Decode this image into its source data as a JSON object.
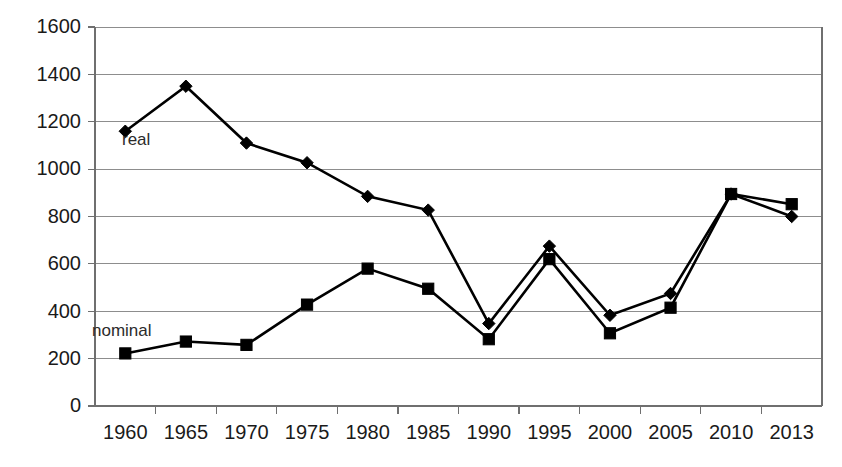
{
  "chart_data": {
    "type": "line",
    "title": "",
    "subtitle": "",
    "xlabel": "",
    "ylabel": "",
    "categories": [
      "1960",
      "1965",
      "1970",
      "1975",
      "1980",
      "1985",
      "1990",
      "1995",
      "2000",
      "2005",
      "2010",
      "2013"
    ],
    "ylim": [
      0,
      1600
    ],
    "ytick_labels": [
      "1600",
      "1400",
      "1200",
      "1000",
      "800",
      "600",
      "400",
      "200",
      "0"
    ],
    "ytick_values": [
      1600,
      1400,
      1200,
      1000,
      800,
      600,
      400,
      200,
      0
    ],
    "ytick_step": 200,
    "grid": true,
    "grid_axis": "y",
    "legend_position": "inline-annotation",
    "series": [
      {
        "name": "real",
        "marker": "diamond",
        "color": "#000000",
        "annotation": "real",
        "values": [
          1160,
          1350,
          1110,
          1027,
          885,
          827,
          348,
          675,
          383,
          475,
          895,
          800
        ]
      },
      {
        "name": "nominal",
        "marker": "square",
        "color": "#000000",
        "annotation": "nominal",
        "values": [
          222,
          272,
          258,
          428,
          580,
          495,
          282,
          620,
          307,
          415,
          895,
          852
        ]
      }
    ],
    "annotations": [
      {
        "text": "real",
        "series": "real",
        "near_category": "1960"
      },
      {
        "text": "nominal",
        "series": "nominal",
        "near_category": "1960"
      }
    ]
  }
}
